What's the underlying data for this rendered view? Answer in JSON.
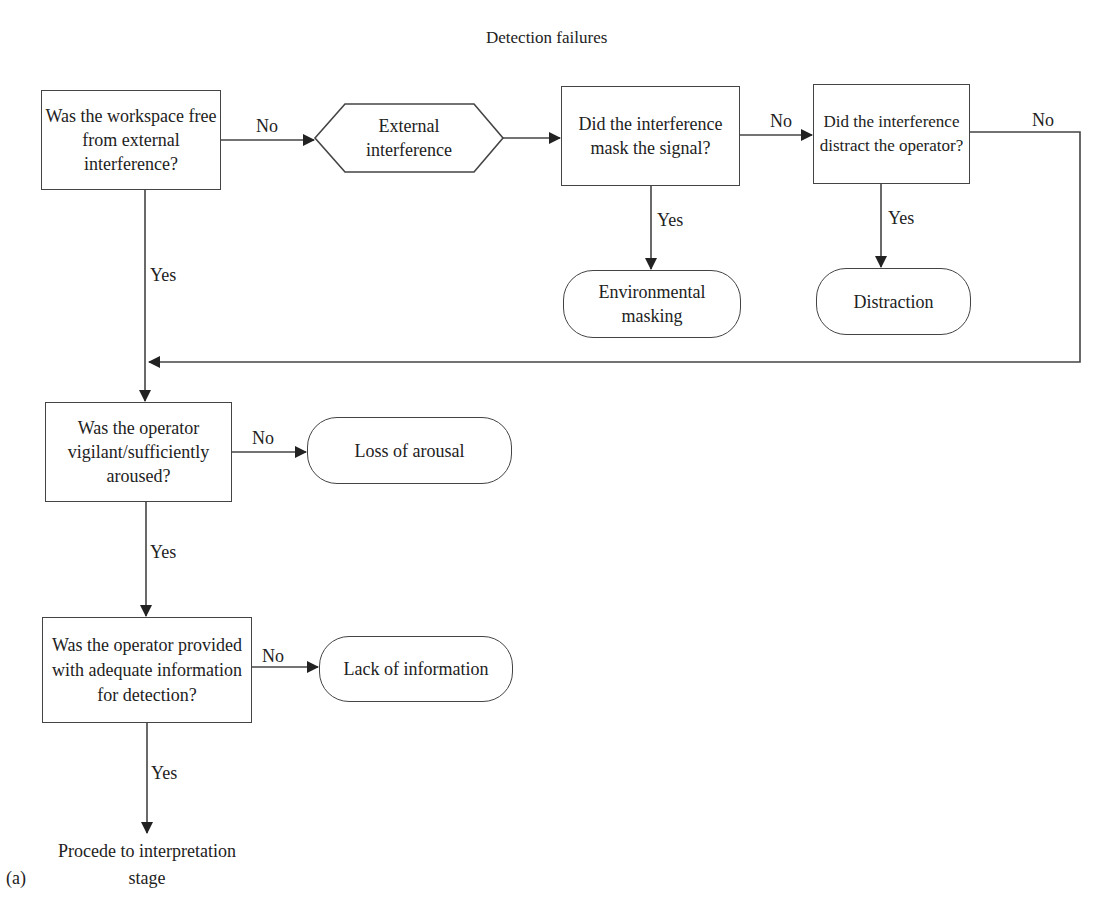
{
  "title": "Detection failures",
  "figure_label": "(a)",
  "nodes": {
    "q_workspace": "Was the workspace free from external interference?",
    "external_interference": "External interference",
    "q_mask": "Did the interference mask the signal?",
    "q_distract": "Did the interference distract the operator?",
    "environmental_masking": "Environmental masking",
    "distraction": "Distraction",
    "q_vigilant": "Was the operator vigilant/sufficiently aroused?",
    "loss_of_arousal": "Loss of arousal",
    "q_information": "Was the operator provided with adequate information for detection?",
    "lack_of_information": "Lack of information",
    "end_line1": "Procede to interpretation",
    "end_line2": "stage"
  },
  "edges": {
    "workspace_no": "No",
    "workspace_yes": "Yes",
    "mask_no": "No",
    "mask_yes": "Yes",
    "distract_no": "No",
    "distract_yes": "Yes",
    "vigilant_no": "No",
    "vigilant_yes": "Yes",
    "information_no": "No",
    "information_yes": "Yes"
  },
  "colors": {
    "stroke": "#444444",
    "text": "#222222",
    "background": "#ffffff"
  }
}
